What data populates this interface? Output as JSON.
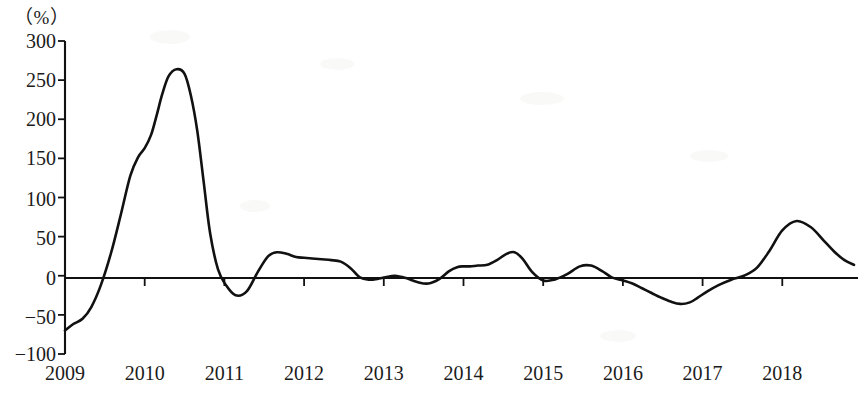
{
  "chart_data": {
    "type": "line",
    "title": "",
    "subtitle": "",
    "xlabel": "（年份）",
    "ylabel": "（%）",
    "unit_label": "（%）",
    "grid": false,
    "legend": null,
    "legend_position": "none",
    "xlim": [
      2009,
      2018.95
    ],
    "ylim": [
      -100,
      300
    ],
    "y_ticks": [
      300,
      250,
      200,
      150,
      100,
      50,
      0,
      -50,
      -100
    ],
    "y_tick_labels": [
      "300",
      "250",
      "200",
      "150",
      "100",
      "50",
      "0",
      "−50",
      "−100"
    ],
    "x_ticks": [
      2009,
      2010,
      2011,
      2012,
      2013,
      2014,
      2015,
      2016,
      2017,
      2018
    ],
    "x_tick_labels": [
      "2009",
      "2010",
      "2011",
      "2012",
      "2013",
      "2014",
      "2015",
      "2016",
      "2017",
      "2018"
    ],
    "series": [
      {
        "name": "同比增长率",
        "color": "#111111",
        "x": [
          2009.0,
          2009.1,
          2009.22,
          2009.33,
          2009.45,
          2009.58,
          2009.7,
          2009.82,
          2009.92,
          2010.0,
          2010.08,
          2010.15,
          2010.22,
          2010.3,
          2010.4,
          2010.5,
          2010.58,
          2010.66,
          2010.74,
          2010.82,
          2010.92,
          2011.02,
          2011.14,
          2011.28,
          2011.42,
          2011.55,
          2011.66,
          2011.78,
          2011.9,
          2012.0,
          2012.1,
          2012.22,
          2012.34,
          2012.46,
          2012.58,
          2012.7,
          2012.82,
          2012.92,
          2013.02,
          2013.14,
          2013.28,
          2013.42,
          2013.56,
          2013.7,
          2013.82,
          2013.92,
          2014.0,
          2014.08,
          2014.18,
          2014.3,
          2014.42,
          2014.54,
          2014.64,
          2014.74,
          2014.86,
          2015.0,
          2015.14,
          2015.3,
          2015.46,
          2015.6,
          2015.74,
          2015.86,
          2016.0,
          2016.12,
          2016.24,
          2016.36,
          2016.48,
          2016.6,
          2016.72,
          2016.84,
          2016.94,
          2017.06,
          2017.2,
          2017.36,
          2017.52,
          2017.68,
          2017.84,
          2018.0,
          2018.18,
          2018.36,
          2018.52,
          2018.66,
          2018.78,
          2018.9
        ],
        "y": [
          -70,
          -62,
          -55,
          -40,
          -12,
          30,
          78,
          128,
          152,
          163,
          180,
          205,
          232,
          255,
          264,
          258,
          230,
          185,
          120,
          55,
          8,
          -12,
          -25,
          -20,
          5,
          25,
          30,
          28,
          24,
          23,
          22,
          21,
          20,
          18,
          10,
          -2,
          -5,
          -4,
          -2,
          0,
          -3,
          -8,
          -10,
          -4,
          6,
          11,
          12,
          12,
          13,
          14,
          20,
          28,
          30,
          22,
          5,
          -6,
          -5,
          2,
          12,
          13,
          6,
          -2,
          -6,
          -10,
          -16,
          -22,
          -28,
          -33,
          -36,
          -34,
          -28,
          -20,
          -12,
          -5,
          0,
          10,
          32,
          58,
          70,
          62,
          45,
          30,
          20,
          14
        ]
      }
    ],
    "annotations": [],
    "notable_points": [
      {
        "label": "start 2009",
        "x": 2009.0,
        "y": -70
      },
      {
        "label": "peak 2010",
        "x": 2010.4,
        "y": 264
      },
      {
        "label": "trough mid-2010",
        "x": 2010.92,
        "y": -25
      },
      {
        "label": "local peak 2011",
        "x": 2011.28,
        "y": 30
      },
      {
        "label": "local peak late-2013",
        "x": 2013.9,
        "y": 30
      },
      {
        "label": "local peak 2015",
        "x": 2015.05,
        "y": 13
      },
      {
        "label": "trough 2016",
        "x": 2016.35,
        "y": -36
      },
      {
        "label": "peak late-2016",
        "x": 2016.85,
        "y": 70
      },
      {
        "label": "local dip 2017.6",
        "x": 2017.55,
        "y": 9
      },
      {
        "label": "local peak 2018.6",
        "x": 2018.55,
        "y": 30
      },
      {
        "label": "end 2018",
        "x": 2018.95,
        "y": -15
      }
    ]
  },
  "axes": {
    "unit_text": "（%）",
    "x_unit_text": "（年份）"
  }
}
